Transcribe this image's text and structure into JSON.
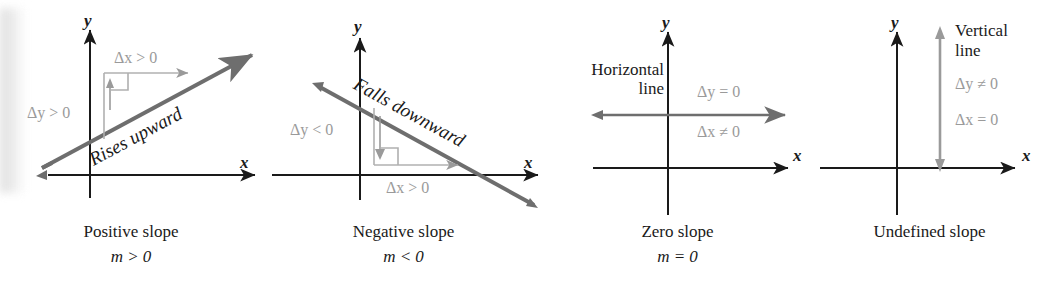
{
  "figure": {
    "axis_color": "#1a1a1a",
    "delta_color": "#9a9a9a",
    "line_color": "#6e6e6e",
    "background": "#ffffff"
  },
  "panels": [
    {
      "id": "positive-slope",
      "y_axis_label": "y",
      "x_axis_label": "x",
      "delta_x": "Δx > 0",
      "delta_y": "Δy > 0",
      "line_note": "Rises upward",
      "caption": "Positive slope",
      "formula": "m > 0"
    },
    {
      "id": "negative-slope",
      "y_axis_label": "y",
      "x_axis_label": "x",
      "delta_x": "Δx > 0",
      "delta_y": "Δy < 0",
      "line_note": "Falls downward",
      "caption": "Negative slope",
      "formula": "m < 0"
    },
    {
      "id": "zero-slope",
      "y_axis_label": "y",
      "x_axis_label": "x",
      "delta_x": "Δx ≠ 0",
      "delta_y": "Δy = 0",
      "line_note": "Horizontal line",
      "line_note_1": "Horizontal",
      "line_note_2": "line",
      "caption": "Zero slope",
      "formula": "m = 0"
    },
    {
      "id": "undefined-slope",
      "y_axis_label": "y",
      "x_axis_label": "x",
      "delta_x": "Δx = 0",
      "delta_y": "Δy ≠ 0",
      "line_note": "Vertical line",
      "line_note_1": "Vertical",
      "line_note_2": "line",
      "caption": "Undefined slope",
      "formula": ""
    }
  ]
}
